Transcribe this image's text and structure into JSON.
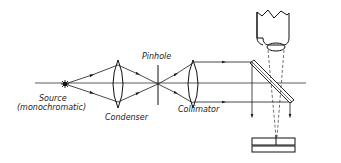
{
  "diagram": {
    "title": "",
    "colors": {
      "ink": "#1a1a1a",
      "background": "#ffffff"
    },
    "labels": {
      "source_line1": "Source",
      "source_line2": "(monochromatic)",
      "condenser": "Condenser",
      "pinhole": "Pinhole",
      "collimator": "Collimator"
    },
    "components": [
      {
        "id": "source",
        "label": "Source (monochromatic)",
        "type": "light-source"
      },
      {
        "id": "condenser",
        "label": "Condenser",
        "type": "convex-lens"
      },
      {
        "id": "pinhole",
        "label": "Pinhole",
        "type": "aperture"
      },
      {
        "id": "collimator",
        "label": "Collimator",
        "type": "convex-lens"
      },
      {
        "id": "beam-splitter",
        "label": "",
        "type": "half-silvered-mirror"
      },
      {
        "id": "microscope",
        "label": "",
        "type": "microscope-objective"
      },
      {
        "id": "sample-plates",
        "label": "",
        "type": "optical-flats"
      }
    ],
    "edges": [
      {
        "from": "source",
        "to": "condenser",
        "style": "ray-arrow"
      },
      {
        "from": "condenser",
        "to": "pinhole",
        "style": "ray-arrow"
      },
      {
        "from": "pinhole",
        "to": "collimator",
        "style": "ray-arrow"
      },
      {
        "from": "collimator",
        "to": "beam-splitter",
        "style": "parallel-rays"
      },
      {
        "from": "beam-splitter",
        "to": "sample-plates",
        "style": "ray-arrow-down"
      },
      {
        "from": "sample-plates",
        "to": "microscope",
        "style": "dashed"
      }
    ]
  }
}
